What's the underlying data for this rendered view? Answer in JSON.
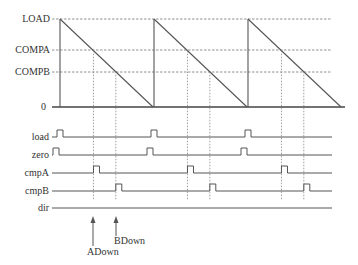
{
  "diagram": {
    "title": "",
    "levels": [
      {
        "key": "load",
        "label": "LOAD"
      },
      {
        "key": "compa",
        "label": "COMPA"
      },
      {
        "key": "compb",
        "label": "COMPB"
      },
      {
        "key": "zero",
        "label": "0"
      }
    ],
    "level_values": {
      "load": 1.0,
      "compa": 0.64,
      "compb": 0.4,
      "zero": 0.0
    },
    "periods": 3,
    "counter_mode": "down-count sawtooth",
    "signals": [
      {
        "key": "load",
        "label": "load",
        "event": "period start (counter = LOAD)"
      },
      {
        "key": "zero",
        "label": "zero",
        "event": "counter = 0"
      },
      {
        "key": "cmpA",
        "label": "cmpA",
        "event": "counter = COMPA"
      },
      {
        "key": "cmpB",
        "label": "cmpB",
        "event": "counter = COMPB"
      },
      {
        "key": "dir",
        "label": "dir",
        "event": "constant (down)"
      }
    ],
    "annotations": [
      {
        "key": "adown",
        "label": "ADown",
        "at": "cmpA event, period 1"
      },
      {
        "key": "bdown",
        "label": "BDown",
        "at": "cmpB event, period 1"
      }
    ],
    "colors": {
      "line": "#555555",
      "text": "#333333",
      "background": "#ffffff"
    }
  }
}
